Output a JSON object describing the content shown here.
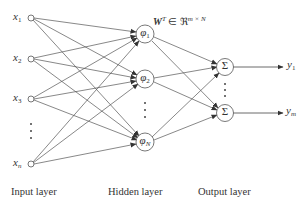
{
  "diagram": {
    "type": "rbf-neural-network",
    "weight_label": {
      "main": "W",
      "sup": "T",
      "in": " ∈ ℜ",
      "dims": "m × N"
    },
    "input_nodes": [
      {
        "name": "x",
        "sub": "1"
      },
      {
        "name": "x",
        "sub": "2"
      },
      {
        "name": "x",
        "sub": "3"
      },
      {
        "name": "x",
        "sub": "n"
      }
    ],
    "hidden_nodes": [
      {
        "name": "φ",
        "sub": "1"
      },
      {
        "name": "φ",
        "sub": "2"
      },
      {
        "name": "φ",
        "sub": "N"
      }
    ],
    "output_nodes": [
      {
        "symbol": "Σ",
        "output": "y",
        "sub": "1"
      },
      {
        "symbol": "Σ",
        "output": "y",
        "sub": "m"
      }
    ],
    "ellipsis": "⋮",
    "layer_labels": {
      "input": "Input layer",
      "hidden": "Hidden layer",
      "output": "Output layer"
    },
    "colors": {
      "stroke": "#444444",
      "text": "#333333",
      "background": "#ffffff"
    }
  }
}
